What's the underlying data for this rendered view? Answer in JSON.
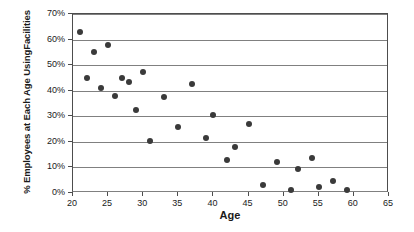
{
  "chart_data": {
    "type": "scatter",
    "title": "",
    "xlabel": "Age",
    "ylabel": "% Employees at Each Age Using Facilities",
    "ylabel_lines": [
      "% Employees at Each Age Using",
      "Facilities"
    ],
    "xlim": [
      20,
      65
    ],
    "ylim": [
      0,
      70
    ],
    "xticks": [
      20,
      25,
      30,
      35,
      40,
      45,
      50,
      55,
      60,
      65
    ],
    "xtick_labels": [
      "20",
      "25",
      "30",
      "35",
      "40",
      "45",
      "50",
      "55",
      "60",
      "65"
    ],
    "yticks": [
      0,
      10,
      20,
      30,
      40,
      50,
      60,
      70
    ],
    "ytick_labels": [
      "0%",
      "10%",
      "20%",
      "30%",
      "40%",
      "50%",
      "60%",
      "70%"
    ],
    "grid": "horizontal",
    "legend": "none",
    "marker": "filled-circle",
    "marker_color": "#3a3a3a",
    "gridline_color": "#808080",
    "axis_color": "#4d4d4d",
    "background_color": "#ffffff",
    "series": [
      {
        "name": "Employees",
        "points": [
          {
            "x": 21,
            "y": 63.0
          },
          {
            "x": 22,
            "y": 45.0
          },
          {
            "x": 23,
            "y": 55.0
          },
          {
            "x": 24,
            "y": 41.0
          },
          {
            "x": 25,
            "y": 58.0
          },
          {
            "x": 26,
            "y": 38.0
          },
          {
            "x": 27,
            "y": 45.0
          },
          {
            "x": 28,
            "y": 43.5
          },
          {
            "x": 29,
            "y": 32.5
          },
          {
            "x": 30,
            "y": 47.5
          },
          {
            "x": 31,
            "y": 20.5
          },
          {
            "x": 33,
            "y": 37.5
          },
          {
            "x": 35,
            "y": 26.0
          },
          {
            "x": 37,
            "y": 42.5
          },
          {
            "x": 39,
            "y": 21.5
          },
          {
            "x": 40,
            "y": 30.5
          },
          {
            "x": 42,
            "y": 13.0
          },
          {
            "x": 43,
            "y": 18.0
          },
          {
            "x": 45,
            "y": 27.0
          },
          {
            "x": 47,
            "y": 3.0
          },
          {
            "x": 49,
            "y": 12.0
          },
          {
            "x": 51,
            "y": 1.0
          },
          {
            "x": 52,
            "y": 9.5
          },
          {
            "x": 54,
            "y": 13.5
          },
          {
            "x": 55,
            "y": 2.5
          },
          {
            "x": 57,
            "y": 4.5
          },
          {
            "x": 59,
            "y": 1.0
          }
        ]
      }
    ]
  }
}
